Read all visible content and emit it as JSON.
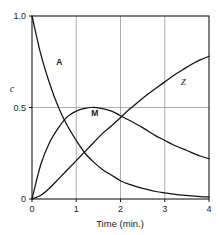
{
  "chart_data": {
    "type": "line",
    "title": "",
    "xlabel": "Time (min.)",
    "ylabel": "c",
    "xlim": [
      0,
      4
    ],
    "ylim": [
      0,
      1.0
    ],
    "grid": true,
    "legend_position": "inline-curve-labels",
    "x_ticks": [
      "0",
      "1",
      "2",
      "3",
      "4"
    ],
    "x_tick_values": [
      0,
      1,
      2,
      3,
      4
    ],
    "y_ticks": [
      "0",
      "0.5",
      "1.0"
    ],
    "y_tick_values": [
      0,
      0.5,
      1.0
    ],
    "series": [
      {
        "name": "A",
        "label": "A",
        "label_x": 0.62,
        "label_y": 0.73,
        "x": [
          0,
          0.2,
          0.4,
          0.6,
          0.8,
          1.0,
          1.2,
          1.4,
          1.6,
          1.8,
          2.0,
          2.2,
          2.4,
          2.6,
          2.8,
          3.0,
          3.2,
          3.4,
          3.6,
          3.8,
          4.0
        ],
        "values": [
          1.0,
          0.79,
          0.63,
          0.5,
          0.4,
          0.32,
          0.25,
          0.2,
          0.16,
          0.13,
          0.1,
          0.08,
          0.065,
          0.052,
          0.041,
          0.033,
          0.026,
          0.021,
          0.017,
          0.013,
          0.011
        ]
      },
      {
        "name": "M",
        "label": "M",
        "label_x": 1.42,
        "label_y": 0.455,
        "x": [
          0,
          0.2,
          0.4,
          0.6,
          0.8,
          1.0,
          1.2,
          1.35,
          1.5,
          1.8,
          2.0,
          2.2,
          2.5,
          2.8,
          3.0,
          3.2,
          3.5,
          3.8,
          4.0
        ],
        "values": [
          0.0,
          0.19,
          0.31,
          0.39,
          0.45,
          0.48,
          0.495,
          0.5,
          0.498,
          0.48,
          0.455,
          0.43,
          0.39,
          0.345,
          0.32,
          0.295,
          0.265,
          0.235,
          0.22
        ]
      },
      {
        "name": "Z",
        "label": "Z",
        "label_x": 3.42,
        "label_y": 0.625,
        "x": [
          0,
          0.2,
          0.4,
          0.6,
          0.8,
          1.0,
          1.2,
          1.4,
          1.6,
          1.8,
          2.0,
          2.2,
          2.4,
          2.6,
          2.8,
          3.0,
          3.2,
          3.4,
          3.6,
          3.8,
          4.0
        ],
        "values": [
          0.0,
          0.02,
          0.06,
          0.11,
          0.16,
          0.21,
          0.26,
          0.31,
          0.36,
          0.4,
          0.445,
          0.49,
          0.53,
          0.57,
          0.605,
          0.64,
          0.675,
          0.705,
          0.735,
          0.76,
          0.78
        ]
      }
    ]
  },
  "axes": {
    "x_title": "Time (min.)",
    "y_title": "c"
  },
  "colors": {
    "curve": "#111111",
    "grid": "#8c8c8c",
    "frame": "#1a1a1a",
    "background": "#ffffff"
  }
}
